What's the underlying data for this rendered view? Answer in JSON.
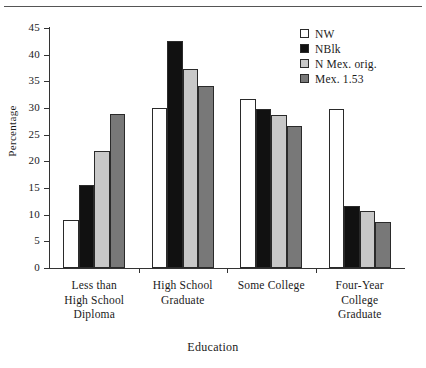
{
  "chart_data": {
    "type": "bar",
    "title": "",
    "xlabel": "Education",
    "ylabel": "Percentage",
    "ylim": [
      0,
      45
    ],
    "yticks": [
      0,
      5,
      10,
      15,
      20,
      25,
      30,
      35,
      40,
      45
    ],
    "grid": false,
    "legend_position": "top-right",
    "categories": [
      "Less than\nHigh School\nDiploma",
      "High School\nGraduate",
      "Some College",
      "Four-Year\nCollege\nGraduate"
    ],
    "series": [
      {
        "name": "NW",
        "color": "#ffffff",
        "values": [
          9.0,
          30.0,
          31.7,
          29.8
        ]
      },
      {
        "name": "NBlk",
        "color": "#111111",
        "values": [
          15.5,
          42.5,
          29.8,
          11.7
        ]
      },
      {
        "name": "N Mex. orig.",
        "color": "#c8c8c8",
        "values": [
          22.0,
          37.3,
          28.7,
          10.7
        ]
      },
      {
        "name": "Mex. 1.53",
        "color": "#787878",
        "values": [
          28.8,
          34.1,
          26.7,
          8.7
        ]
      }
    ]
  },
  "axis": {
    "y_title": "Percentage",
    "x_title": "Education",
    "y_tick_labels": [
      "0",
      "5",
      "10",
      "15",
      "20",
      "25",
      "30",
      "35",
      "40",
      "45"
    ]
  },
  "legend": {
    "entries": [
      {
        "label": "NW"
      },
      {
        "label": "NBlk"
      },
      {
        "label": "N Mex. orig."
      },
      {
        "label": "Mex. 1.53"
      }
    ]
  }
}
